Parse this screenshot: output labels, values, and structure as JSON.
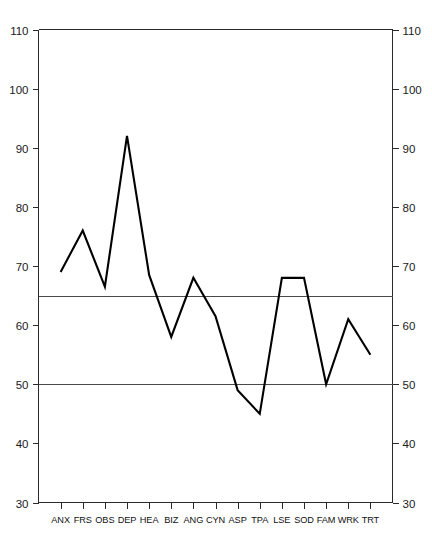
{
  "chart_data": {
    "type": "line",
    "title": "",
    "subtitle": "",
    "xlabel": "",
    "ylabel": "",
    "categories": [
      "ANX",
      "FRS",
      "OBS",
      "DEP",
      "HEA",
      "BIZ",
      "ANG",
      "CYN",
      "ASP",
      "TPA",
      "LSE",
      "SOD",
      "FAM",
      "WRK",
      "TRT"
    ],
    "values": [
      69,
      76,
      66.5,
      92,
      68.5,
      58,
      68,
      61.5,
      49,
      45,
      68,
      68,
      50,
      61,
      55
    ],
    "series": [
      {
        "name": "profile",
        "values": [
          69,
          76,
          66.5,
          92,
          68.5,
          58,
          68,
          61.5,
          49,
          45,
          68,
          68,
          50,
          61,
          55
        ]
      }
    ],
    "ylim": [
      30,
      110
    ],
    "yticks": [
      30,
      40,
      50,
      60,
      70,
      80,
      90,
      100,
      110
    ],
    "ytick_labels_left": [
      "30",
      "40",
      "50",
      "60",
      "70",
      "80",
      "90",
      "100",
      "110"
    ],
    "ytick_labels_right": [
      "30",
      "40",
      "50",
      "60",
      "70",
      "80",
      "90",
      "100",
      "110"
    ],
    "reference_lines": [
      {
        "value": 65,
        "label": "65"
      },
      {
        "value": 50,
        "label": "50"
      }
    ],
    "grid": false,
    "legend": null,
    "legend_position": "none",
    "axis_left_label": "",
    "axis_right_label": "",
    "marker": "none",
    "line_color": "#000000"
  },
  "colors": {
    "line": "#000000",
    "axis": "#2a2a2a",
    "reference": "#4a4a4a",
    "text": "#111111",
    "background": "#ffffff"
  }
}
